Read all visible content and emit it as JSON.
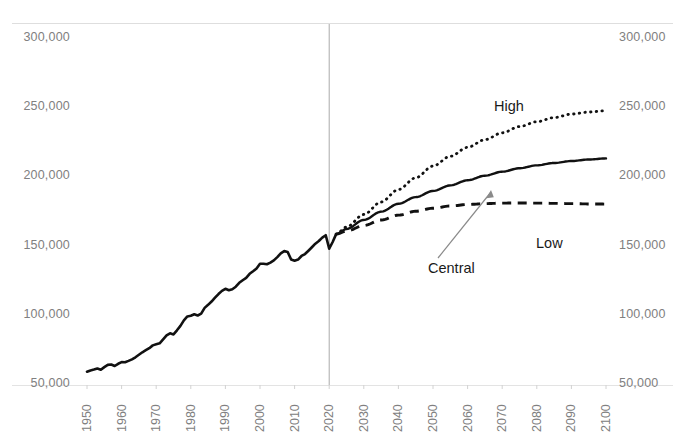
{
  "chart_data": {
    "type": "line",
    "title": "",
    "subtitle": "",
    "xlabel": "",
    "ylabel": "",
    "xlim": [
      1950,
      2100
    ],
    "ylim": [
      50000,
      300000
    ],
    "grid": false,
    "legend_position": "inline-annotations",
    "y_ticks": [
      "50,000",
      "100,000",
      "150,000",
      "200,000",
      "250,000",
      "300,000"
    ],
    "y_tick_values": [
      50000,
      100000,
      150000,
      200000,
      250000,
      300000
    ],
    "x_ticks": [
      "1950",
      "1960",
      "1970",
      "1980",
      "1990",
      "2000",
      "2010",
      "2020",
      "2030",
      "2040",
      "2050",
      "2060",
      "2070",
      "2080",
      "2090",
      "2100"
    ],
    "x_tick_values": [
      1950,
      1960,
      1970,
      1980,
      1990,
      2000,
      2010,
      2020,
      2030,
      2040,
      2050,
      2060,
      2070,
      2080,
      2090,
      2100
    ],
    "annotations": [
      {
        "text": "High",
        "x": 2058,
        "y": 244000
      },
      {
        "text": "Low",
        "x": 2071,
        "y": 146000
      },
      {
        "text": "Central",
        "x": 2052,
        "y": 117000
      }
    ],
    "divider_line": {
      "x": 2020,
      "label": "projection-start",
      "color": "#aaaaaa"
    },
    "series": [
      {
        "name": "Historical",
        "style": "solid",
        "color": "#111111",
        "x": [
          1950,
          1951,
          1952,
          1953,
          1954,
          1955,
          1956,
          1957,
          1958,
          1959,
          1960,
          1961,
          1962,
          1963,
          1964,
          1965,
          1966,
          1967,
          1968,
          1969,
          1970,
          1971,
          1972,
          1973,
          1974,
          1975,
          1976,
          1977,
          1978,
          1979,
          1980,
          1981,
          1982,
          1983,
          1984,
          1985,
          1986,
          1987,
          1988,
          1989,
          1990,
          1991,
          1992,
          1993,
          1994,
          1995,
          1996,
          1997,
          1998,
          1999,
          2000,
          2001,
          2002,
          2003,
          2004,
          2005,
          2006,
          2007,
          2008,
          2009,
          2010,
          2011,
          2012,
          2013,
          2014,
          2015,
          2016,
          2017,
          2018,
          2019,
          2020,
          2021,
          2022
        ],
        "values": [
          58900,
          59800,
          60400,
          61200,
          60300,
          62200,
          63800,
          64100,
          63000,
          64600,
          65800,
          65700,
          66700,
          67800,
          69300,
          71100,
          72900,
          74400,
          75900,
          77900,
          78700,
          79400,
          82200,
          85100,
          86600,
          85800,
          88800,
          92000,
          96000,
          98800,
          99300,
          100400,
          99500,
          100800,
          105000,
          107200,
          109600,
          112400,
          115000,
          117300,
          118800,
          117700,
          118500,
          120300,
          123100,
          125000,
          126700,
          129600,
          131500,
          133500,
          136900,
          136900,
          136500,
          137700,
          139300,
          141700,
          144400,
          146000,
          145400,
          139900,
          139100,
          139900,
          142500,
          143900,
          146300,
          148800,
          151400,
          153300,
          155800,
          157500,
          147800,
          152600,
          158300
        ],
        "last_value": 158300
      },
      {
        "name": "Central",
        "style": "solid",
        "color": "#111111",
        "x": [
          2022,
          2025,
          2030,
          2035,
          2040,
          2045,
          2050,
          2055,
          2060,
          2065,
          2070,
          2075,
          2080,
          2085,
          2090,
          2095,
          2100
        ],
        "values": [
          158300,
          162000,
          168500,
          174500,
          180200,
          185000,
          189500,
          193500,
          197200,
          200500,
          203400,
          205900,
          208000,
          209700,
          211100,
          212200,
          213000
        ],
        "last_value": 213000
      },
      {
        "name": "High",
        "style": "dotted",
        "color": "#111111",
        "x": [
          2022,
          2025,
          2030,
          2035,
          2040,
          2045,
          2050,
          2055,
          2060,
          2065,
          2070,
          2075,
          2080,
          2085,
          2090,
          2095,
          2100
        ],
        "values": [
          158300,
          163500,
          172500,
          181500,
          190500,
          199000,
          207500,
          214500,
          221000,
          226500,
          231500,
          236000,
          239500,
          242500,
          245000,
          246500,
          247500
        ],
        "last_value": 247500
      },
      {
        "name": "Low",
        "style": "dashed",
        "color": "#111111",
        "x": [
          2022,
          2025,
          2030,
          2035,
          2040,
          2045,
          2050,
          2055,
          2060,
          2065,
          2070,
          2075,
          2080,
          2085,
          2090,
          2095,
          2100
        ],
        "values": [
          158300,
          160500,
          164500,
          168500,
          172000,
          174800,
          177000,
          178600,
          179700,
          180300,
          180700,
          180800,
          180700,
          180500,
          180300,
          180100,
          180000
        ],
        "last_value": 180000
      }
    ]
  },
  "axes": {
    "left": {
      "ticks": [
        "300,000",
        "250,000",
        "200,000",
        "150,000",
        "100,000",
        "50,000"
      ]
    },
    "right": {
      "ticks": [
        "300,000",
        "250,000",
        "200,000",
        "150,000",
        "100,000",
        "50,000"
      ]
    },
    "bottom": {
      "ticks": [
        "1950",
        "1960",
        "1970",
        "1980",
        "1990",
        "2000",
        "2010",
        "2020",
        "2030",
        "2040",
        "2050",
        "2060",
        "2070",
        "2080",
        "2090",
        "2100"
      ]
    }
  },
  "annotations": {
    "high": "High",
    "low": "Low",
    "central": "Central"
  },
  "colors": {
    "line": "#111111",
    "tick_text": "#808080",
    "annotation_text": "#1a1a1a",
    "divider": "#aaaaaa",
    "plot_border": "#d9d9d9",
    "background": "#ffffff"
  }
}
